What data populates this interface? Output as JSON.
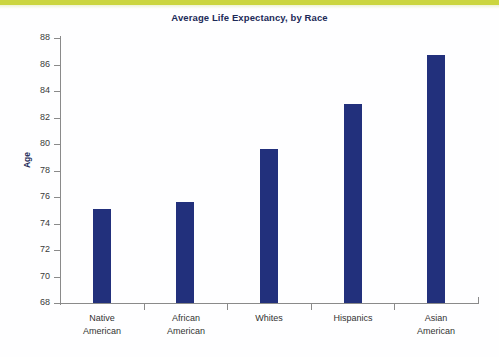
{
  "page": {
    "background_color": "#fefeff",
    "accent_strip_color": "#cbd53f"
  },
  "chart_data": {
    "type": "bar",
    "title": "Average Life Expectancy, by Race",
    "xlabel": "",
    "ylabel": "Age",
    "categories": [
      "Native\nAmerican",
      "African\nAmerican",
      "Whites",
      "Hispanics",
      "Asian\nAmerican"
    ],
    "values": [
      75.1,
      75.6,
      79.6,
      83.0,
      86.7
    ],
    "ylim": [
      68,
      88
    ],
    "yticks": [
      68,
      70,
      72,
      74,
      76,
      78,
      80,
      82,
      84,
      86,
      88
    ],
    "ytick_labels": [
      "68",
      "70",
      "72",
      "74",
      "76",
      "78",
      "80",
      "82",
      "84",
      "86",
      "88"
    ],
    "grid": false,
    "legend": null,
    "series_color": "#22307c",
    "axis_color": "#8a8a8a",
    "title_color": "#1c2a58"
  }
}
